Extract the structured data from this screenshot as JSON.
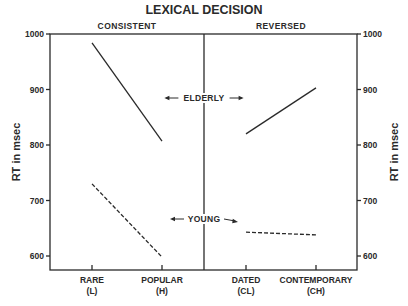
{
  "chart_data": {
    "type": "line",
    "title": "LEXICAL DECISION",
    "ylabel": "RT in msec",
    "ylabel_right": "RT in msec",
    "ylim": [
      578,
      1000
    ],
    "yticks": [
      600,
      700,
      800,
      900,
      1000
    ],
    "grid": false,
    "panels": [
      {
        "name": "CONSISTENT",
        "categories": [
          {
            "label": "RARE",
            "sub": "(L)"
          },
          {
            "label": "POPULAR",
            "sub": "(H)"
          }
        ]
      },
      {
        "name": "REVERSED",
        "categories": [
          {
            "label": "DATED",
            "sub": "(CL)"
          },
          {
            "label": "CONTEMPORARY",
            "sub": "(CH)"
          }
        ]
      }
    ],
    "series": [
      {
        "name": "ELDERLY",
        "style": "solid",
        "consistent": [
          984,
          807
        ],
        "reversed": [
          820,
          903
        ]
      },
      {
        "name": "YOUNG",
        "style": "dashed",
        "consistent": [
          730,
          598
        ],
        "reversed": [
          643,
          638
        ]
      }
    ],
    "annotations": [
      "ELDERLY",
      "YOUNG"
    ]
  }
}
